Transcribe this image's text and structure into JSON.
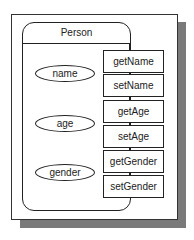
{
  "diagram": {
    "class_name": "Person",
    "attributes": [
      {
        "label": "name"
      },
      {
        "label": "age"
      },
      {
        "label": "gender"
      }
    ],
    "methods": [
      {
        "label": "getName"
      },
      {
        "label": "setName"
      },
      {
        "label": "getAge"
      },
      {
        "label": "setAge"
      },
      {
        "label": "getGender"
      },
      {
        "label": "setGender"
      }
    ],
    "colors": {
      "line": "#222222",
      "shadow": "#7a7a7a",
      "background": "#ffffff"
    }
  }
}
